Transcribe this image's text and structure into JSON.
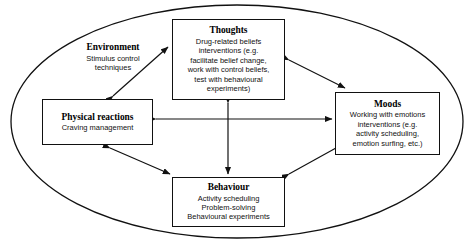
{
  "figure": {
    "container": {
      "shape_name": "ellipse-boundary",
      "label": "Environment",
      "lines": [
        "Stimulus control",
        "techniques"
      ]
    },
    "nodes": [
      {
        "id": "thoughts",
        "title": "Thoughts",
        "lines": [
          "Drug-related beliefs",
          "interventions (e.g.",
          "facilitate belief change,",
          "work with control beliefs,",
          "test with behavioural",
          "experiments)"
        ]
      },
      {
        "id": "physical",
        "title": "Physical reactions",
        "lines": [
          "Craving management"
        ]
      },
      {
        "id": "moods",
        "title": "Moods",
        "lines": [
          "Working with emotions",
          "interventions (e.g.",
          "activity scheduling,",
          "emotion surfing, etc.)"
        ]
      },
      {
        "id": "behaviour",
        "title": "Behaviour",
        "lines": [
          "Activity scheduling",
          "Problem-solving",
          "Behavioural experiments"
        ]
      }
    ],
    "caption": "",
    "colors": {
      "stroke": "#111111",
      "background": "#ffffff",
      "text": "#000000"
    }
  }
}
